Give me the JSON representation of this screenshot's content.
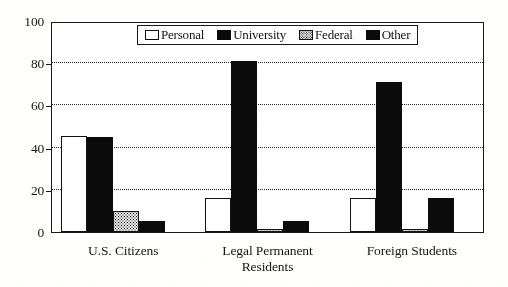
{
  "chart_data": {
    "type": "bar",
    "title": "",
    "subtitle": "",
    "xlabel": "",
    "ylabel": "",
    "ylim": [
      0,
      100
    ],
    "yticks": [
      0,
      20,
      40,
      60,
      80,
      100
    ],
    "ytick_labels": [
      "0",
      "20",
      "40",
      "60",
      "80",
      "100"
    ],
    "gridlines": [
      20,
      40,
      60,
      80
    ],
    "grid": true,
    "legend_position": "top-center",
    "categories": [
      "U.S. Citizens",
      "Legal Permanent Residents",
      "Foreign Students"
    ],
    "category_lines": [
      [
        "U.S. Citizens"
      ],
      [
        "Legal Permanent",
        "Residents"
      ],
      [
        "Foreign Students"
      ]
    ],
    "series": [
      {
        "name": "Personal",
        "key": "personal",
        "color": "#ffffff",
        "pattern": "outline",
        "values": [
          45.5,
          16,
          16
        ]
      },
      {
        "name": "University",
        "key": "university",
        "color": "#0d0d0d",
        "pattern": "solid",
        "values": [
          45,
          81,
          71
        ]
      },
      {
        "name": "Federal",
        "key": "federal",
        "color": "#dcdcdc",
        "pattern": "stipple",
        "values": [
          10,
          1.5,
          1.5
        ]
      },
      {
        "name": "Other",
        "key": "other",
        "color": "#0d0d0d",
        "pattern": "solid",
        "values": [
          5,
          5,
          16
        ]
      }
    ]
  },
  "legend": {
    "items": [
      {
        "label": "Personal",
        "key": "personal"
      },
      {
        "label": "University",
        "key": "university"
      },
      {
        "label": "Federal",
        "key": "federal"
      },
      {
        "label": "Other",
        "key": "other"
      }
    ]
  },
  "colors": {
    "axis": "#1a1a1a",
    "grid": "#2a2a2a",
    "bar_dark": "#0d0d0d",
    "bar_light": "#ffffff",
    "background": "#fdfdfc"
  }
}
